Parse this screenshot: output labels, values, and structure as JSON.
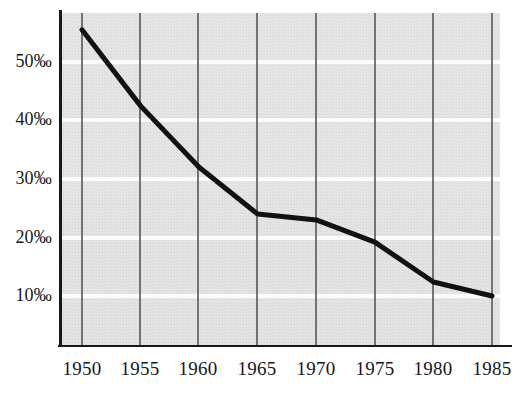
{
  "chart_data": {
    "type": "line",
    "title": "",
    "subtitle": "",
    "xlabel": "",
    "ylabel": "",
    "x": [
      1950,
      1955,
      1960,
      1965,
      1970,
      1975,
      1980,
      1985
    ],
    "values": [
      55.5,
      42.5,
      32.0,
      24.0,
      23.0,
      19.2,
      12.4,
      10.0
    ],
    "series": [
      {
        "name": "rate",
        "values": [
          55.5,
          42.5,
          32.0,
          24.0,
          23.0,
          19.2,
          12.4,
          10.0
        ]
      }
    ],
    "xlim": [
      1950,
      1985
    ],
    "ylim": [
      6.5,
      57.5
    ],
    "xticks": [
      1950,
      1955,
      1960,
      1965,
      1970,
      1975,
      1980,
      1985
    ],
    "xticklabels": [
      "1950",
      "1955",
      "1960",
      "1965",
      "1970",
      "1975",
      "1980",
      "1985"
    ],
    "yticks": [
      10,
      20,
      30,
      40,
      50
    ],
    "yticklabels": [
      "10‰",
      "20‰",
      "30‰",
      "40‰",
      "50‰"
    ],
    "grid": "both",
    "grid_vertical_color": "#4a4a50",
    "grid_horizontal_color": "#ffffff",
    "legend": "none",
    "line_color": "#111114",
    "line_width": 5,
    "plot_background": "#e2e2e2",
    "axis_color": "#1a1a1d",
    "annotations": []
  },
  "axes": {
    "y_labels": [
      {
        "text": "50‰",
        "value": 50
      },
      {
        "text": "40‰",
        "value": 40
      },
      {
        "text": "30‰",
        "value": 30
      },
      {
        "text": "20‰",
        "value": 20
      },
      {
        "text": "10‰",
        "value": 10
      }
    ],
    "x_labels": [
      {
        "text": "1950",
        "value": 1950
      },
      {
        "text": "1955",
        "value": 1955
      },
      {
        "text": "1960",
        "value": 1960
      },
      {
        "text": "1965",
        "value": 1965
      },
      {
        "text": "1970",
        "value": 1970
      },
      {
        "text": "1975",
        "value": 1975
      },
      {
        "text": "1980",
        "value": 1980
      },
      {
        "text": "1985",
        "value": 1985
      }
    ]
  },
  "geometry": {
    "plot_left": 60,
    "plot_right": 500,
    "plot_top": 13,
    "plot_bottom": 345,
    "x_positions": [
      82,
      140,
      198,
      257,
      316,
      375,
      433,
      492
    ],
    "y_positions": [
      62,
      120,
      179,
      238,
      296
    ],
    "curve_points": "82,30 140,106 198,168 257,214 316,219 375,242 433,282 492,296"
  }
}
